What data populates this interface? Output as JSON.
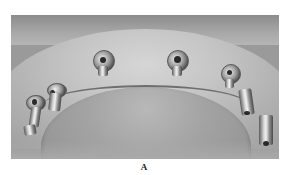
{
  "figure": {
    "type": "grayscale clinical photograph",
    "caption_label": "A",
    "implants": [
      {
        "name": "left-distal",
        "x": 22,
        "y": 103,
        "style": "angled-abutment"
      },
      {
        "name": "left-mesial",
        "x": 47,
        "y": 85,
        "style": "angled-abutment"
      },
      {
        "name": "anterior-left",
        "x": 102,
        "y": 58,
        "style": "healing-cap"
      },
      {
        "name": "anterior-right",
        "x": 174,
        "y": 58,
        "style": "healing-cap"
      },
      {
        "name": "right-mesial",
        "x": 228,
        "y": 71,
        "style": "healing-cap"
      },
      {
        "name": "right-distal-1",
        "x": 243,
        "y": 95,
        "style": "angled-abutment"
      },
      {
        "name": "right-distal-2",
        "x": 258,
        "y": 118,
        "style": "angled-abutment"
      }
    ]
  }
}
